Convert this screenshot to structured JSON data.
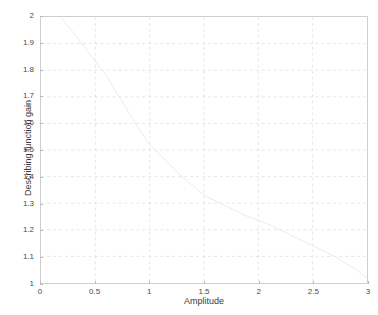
{
  "chart_data": {
    "type": "line",
    "title": "",
    "xlabel": "Amplitude",
    "ylabel": "Describing function gain",
    "xlim": [
      0,
      3
    ],
    "ylim": [
      1,
      2
    ],
    "grid": true,
    "legend": null,
    "xticks": [
      "0",
      "0.5",
      "1",
      "1.5",
      "2",
      "2.5",
      "3"
    ],
    "xtick_values": [
      0,
      0.5,
      1,
      1.5,
      2,
      2.5,
      3
    ],
    "yticks": [
      "1",
      "1.1",
      "1.2",
      "1.3",
      "1.4",
      "1.5",
      "1.6",
      "1.7",
      "1.8",
      "1.9",
      "2"
    ],
    "ytick_values": [
      1,
      1.1,
      1.2,
      1.3,
      1.4,
      1.5,
      1.6,
      1.7,
      1.8,
      1.9,
      2.0
    ],
    "series": [
      {
        "name": "Describing function gain",
        "color": "#e8e8e8",
        "x": [
          0.18,
          0.3,
          0.45,
          0.6,
          0.75,
          0.9,
          1.0,
          1.15,
          1.3,
          1.5,
          1.7,
          1.9,
          2.1,
          2.3,
          2.5,
          2.7,
          2.9,
          3.0
        ],
        "values": [
          2.0,
          1.94,
          1.86,
          1.78,
          1.68,
          1.58,
          1.52,
          1.46,
          1.4,
          1.33,
          1.29,
          1.25,
          1.22,
          1.18,
          1.14,
          1.1,
          1.05,
          1.02
        ]
      }
    ],
    "colors": {
      "axis": "#cfcfcf",
      "grid": "#dcdcdc",
      "tick_text": "#4a4a4a",
      "label_text": "#3a3a3a",
      "background": "#ffffff",
      "series": "#e8e8e8"
    }
  }
}
